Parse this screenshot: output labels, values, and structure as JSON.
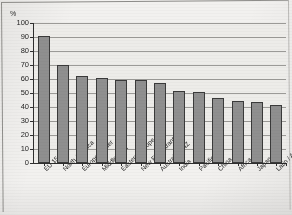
{
  "chart_data": {
    "type": "bar",
    "title": "",
    "xlabel": "",
    "ylabel": "%",
    "ylim": [
      0,
      100
    ],
    "ytick_step": 10,
    "grid": true,
    "legend": "none",
    "bar_color": "#8f8f8f",
    "bar_border_color": "#3a3a3a",
    "plot_background": "#edece9",
    "categories": [
      "EU 15",
      "North America",
      "Europe - other",
      "Middle East",
      "Eastern Europe",
      "New EU entrants",
      "Australia / NZ",
      "India",
      "Pacific Rim",
      "China",
      "Africa",
      "Japan",
      "Latin / America"
    ],
    "values": [
      90.5,
      70,
      62,
      60.5,
      59,
      59,
      57.5,
      51.5,
      50.5,
      46.5,
      44,
      43.5,
      41.5
    ],
    "ytick_labels": [
      "100",
      "90",
      "80",
      "70",
      "60",
      "50",
      "40",
      "30",
      "20",
      "10",
      "0"
    ]
  }
}
